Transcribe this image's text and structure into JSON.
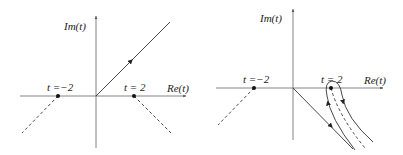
{
  "left_panel": {
    "y_axis_label": "Im(t)",
    "x_axis_label": "Re(t)",
    "point_neg_label": "t =−2",
    "point_pos_label": "t = 2",
    "contour": "ray from origin into upper-right quadrant with arrow pointing outward",
    "branch_cuts": "dashed lines from t=-2 and t=2 going downward"
  },
  "right_panel": {
    "y_axis_label": "Im(t)",
    "x_axis_label": "Re(t)",
    "point_neg_label": "t =−2",
    "point_pos_label": "t = 2",
    "contour": "ray from origin into lower-right quadrant plus keyhole contour wrapping the branch cut at t=2",
    "branch_cuts": "dashed lines from t=-2 and t=2 going downward"
  },
  "colors": {
    "axis": "#555555",
    "line": "#333333",
    "dot": "#111111"
  }
}
